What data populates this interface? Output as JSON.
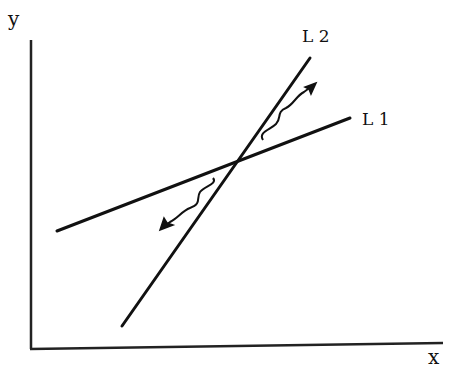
{
  "diagram": {
    "axes": {
      "x_label": "x",
      "y_label": "y"
    },
    "lines": [
      {
        "name": "L1",
        "label": "L 1",
        "from": [
          57,
          231
        ],
        "to": [
          350,
          118
        ]
      },
      {
        "name": "L2",
        "label": "L 2",
        "from": [
          122,
          326
        ],
        "to": [
          310,
          58
        ]
      }
    ],
    "intersection": [
      234,
      163
    ],
    "arrows": [
      {
        "name": "upward-shift-arrow",
        "direction": "up-right",
        "description": "wavy arrow between L1 and L2 pointing away from intersection"
      },
      {
        "name": "downward-shift-arrow",
        "direction": "down-left",
        "description": "wavy arrow between L1 and L2 pointing away from intersection"
      }
    ],
    "colors": {
      "ink": "#111111",
      "background": "#ffffff"
    }
  }
}
